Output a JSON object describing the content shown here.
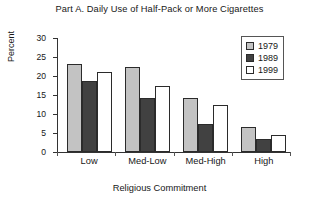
{
  "chart_data": {
    "type": "bar",
    "title": "Part A.  Daily Use of Half-Pack or More Cigarettes",
    "xlabel": "Religious Commitment",
    "ylabel": "Percent",
    "ylim": [
      0,
      30
    ],
    "yticks": [
      0,
      5,
      10,
      15,
      20,
      25,
      30
    ],
    "ytick_labels": [
      "0",
      "5",
      "10",
      "15",
      "20",
      "25",
      "30"
    ],
    "grid": false,
    "legend_position": "top-right",
    "categories": [
      "Low",
      "Med-Low",
      "Med-High",
      "High"
    ],
    "series": [
      {
        "name": "1979",
        "color": "#c3c3c3",
        "values": [
          23.1,
          22.3,
          14.3,
          6.7
        ]
      },
      {
        "name": "1989",
        "color": "#414141",
        "values": [
          18.7,
          14.3,
          7.5,
          3.4
        ]
      },
      {
        "name": "1999",
        "color": "#ffffff",
        "values": [
          21.1,
          17.3,
          12.3,
          4.5
        ]
      }
    ]
  },
  "colors": {
    "axis": "#333333",
    "text": "#171717",
    "bar_outline": "#2b2b2b",
    "legend_border": "#555555",
    "background": "#ffffff"
  }
}
